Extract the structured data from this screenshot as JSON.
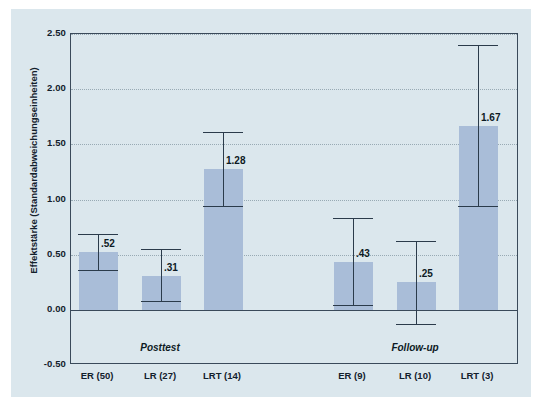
{
  "chart_data": {
    "type": "bar",
    "title": "",
    "subtitle": "",
    "xlabel": "",
    "ylabel": "Effektstärke (Standardabweichungseinheiten)",
    "ylim": [
      -0.5,
      2.5
    ],
    "yticks": [
      "2.50",
      "2.00",
      "1.50",
      "1.00",
      "0.50",
      "0.00",
      "-0.50"
    ],
    "ytick_values": [
      2.5,
      2.0,
      1.5,
      1.0,
      0.5,
      0.0,
      -0.5
    ],
    "grid": true,
    "legend": "none",
    "categories": [
      "ER (50)",
      "LR (27)",
      "LRT (14)",
      "ER (9)",
      "LR (10)",
      "LRT (3)"
    ],
    "values": [
      0.52,
      0.31,
      1.28,
      0.43,
      0.25,
      1.67
    ],
    "value_labels": [
      ".52",
      ".31",
      "1.28",
      ".43",
      ".25",
      "1.67"
    ],
    "error_low": [
      0.36,
      0.08,
      0.94,
      0.04,
      -0.13,
      0.94
    ],
    "error_high": [
      0.69,
      0.55,
      1.61,
      0.83,
      0.62,
      2.4
    ],
    "groups": [
      {
        "label": "Posttest",
        "members": [
          "ER (50)",
          "LR (27)",
          "LRT (14)"
        ]
      },
      {
        "label": "Follow-up",
        "members": [
          "ER (9)",
          "LR (10)",
          "LRT (3)"
        ]
      }
    ],
    "colors": {
      "panel_background": "#dbe7ed",
      "bar_fill": "#a9bdd8",
      "axis_line": "#3a4a5a",
      "error_bar": "#2b3b4b",
      "gridline": "#98aab4",
      "text": "#12202c"
    }
  }
}
